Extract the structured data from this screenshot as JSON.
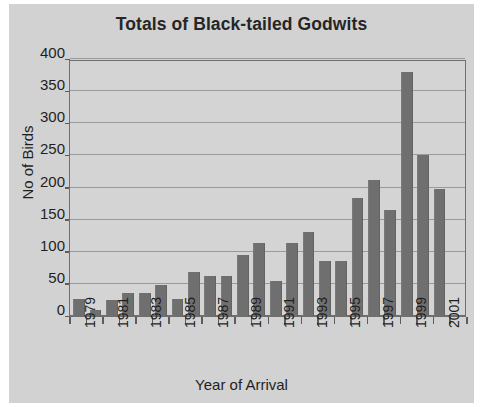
{
  "chart_data": {
    "type": "bar",
    "title": "Totals of Black-tailed Godwits",
    "xlabel": "Year of Arrival",
    "ylabel": "No of Birds",
    "ylim": [
      0,
      400
    ],
    "ytick_values": [
      0,
      50,
      100,
      150,
      200,
      250,
      300,
      350,
      400
    ],
    "ytick_labels": [
      "0",
      "50",
      "100",
      "150",
      "200",
      "250",
      "300",
      "350",
      "400"
    ],
    "grid": true,
    "legend": "none",
    "bar_color": "#6f6f6f",
    "plot_background": "#d4d4d4",
    "figure_background": "#d2d2d2",
    "categories": [
      "1979",
      "1980",
      "1981",
      "1982",
      "1983",
      "1984",
      "1985",
      "1986",
      "1987",
      "1988",
      "1989",
      "1990",
      "1991",
      "1992",
      "1993",
      "1994",
      "1995",
      "1996",
      "1997",
      "1998",
      "1999",
      "2000",
      "2001",
      "2002"
    ],
    "xtick_labels_shown": [
      "1979",
      "1981",
      "1983",
      "1985",
      "1987",
      "1989",
      "1991",
      "1993",
      "1995",
      "1997",
      "1999",
      "2001"
    ],
    "values": [
      27,
      10,
      25,
      36,
      36,
      48,
      27,
      68,
      63,
      63,
      95,
      113,
      55,
      114,
      131,
      85,
      85,
      184,
      212,
      165,
      380,
      250,
      197,
      0
    ]
  }
}
